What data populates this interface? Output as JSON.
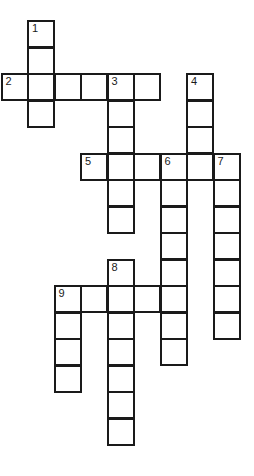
{
  "puzzle": {
    "type": "crossword",
    "colors": {
      "line": "#1a1a1a",
      "cell_fill": "#ffffff",
      "background": "#ffffff"
    },
    "words": [
      {
        "number": "1",
        "direction": "down",
        "col": 1,
        "row": 0,
        "length": 4
      },
      {
        "number": "2",
        "direction": "across",
        "col": 0,
        "row": 2,
        "length": 6
      },
      {
        "number": "3",
        "direction": "down",
        "col": 4,
        "row": 2,
        "length": 6
      },
      {
        "number": "4",
        "direction": "down",
        "col": 7,
        "row": 2,
        "length": 4
      },
      {
        "number": "5",
        "direction": "across",
        "col": 3,
        "row": 5,
        "length": 6
      },
      {
        "number": "6",
        "direction": "down",
        "col": 6,
        "row": 5,
        "length": 8
      },
      {
        "number": "7",
        "direction": "down",
        "col": 8,
        "row": 5,
        "length": 7
      },
      {
        "number": "8",
        "direction": "down",
        "col": 4,
        "row": 9,
        "length": 7
      },
      {
        "number": "9",
        "direction": "across",
        "col": 2,
        "row": 10,
        "length": 5
      },
      {
        "number": "9",
        "direction": "down",
        "col": 2,
        "row": 10,
        "length": 4
      }
    ]
  }
}
